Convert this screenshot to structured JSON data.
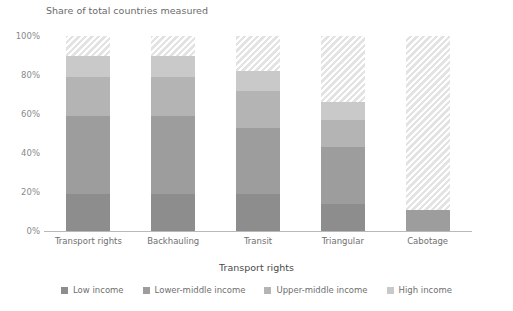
{
  "chart_data": {
    "type": "bar",
    "subtype": "stacked-bar",
    "title": "Share of total countries measured",
    "xlabel": "Transport rights",
    "ylabel": "",
    "categories": [
      "Transport rights",
      "Backhauling",
      "Transit",
      "Triangular",
      "Cabotage"
    ],
    "ylim": [
      0,
      100
    ],
    "ytick_labels": [
      "0%",
      "20%",
      "40%",
      "60%",
      "80%",
      "100%"
    ],
    "ytick_values": [
      0,
      20,
      40,
      60,
      80,
      100
    ],
    "grid": false,
    "legend_position": "bottom",
    "value_unit": "%",
    "series": [
      {
        "name": "Low income",
        "color": "#8d8d8d",
        "values": [
          19,
          19,
          19,
          14,
          0
        ]
      },
      {
        "name": "Lower-middle income",
        "color": "#9d9d9d",
        "values": [
          40,
          40,
          34,
          29,
          11
        ]
      },
      {
        "name": "Upper-middle income",
        "color": "#b4b4b4",
        "values": [
          20,
          20,
          19,
          14,
          0
        ]
      },
      {
        "name": "High income",
        "color": "#c9c9c9",
        "values": [
          11,
          11,
          10,
          9,
          0
        ]
      },
      {
        "name": "Not measured",
        "color": "#e3e3e3",
        "hatched": true,
        "in_legend": false,
        "values": [
          10,
          10,
          18,
          34,
          89
        ]
      }
    ],
    "totals_measured": [
      90,
      90,
      82,
      66,
      11
    ]
  },
  "legend": {
    "items": [
      {
        "label": "Low income",
        "color": "#8d8d8d"
      },
      {
        "label": "Lower-middle income",
        "color": "#9d9d9d"
      },
      {
        "label": "Upper-middle income",
        "color": "#b4b4b4"
      },
      {
        "label": "High income",
        "color": "#c9c9c9"
      }
    ]
  }
}
